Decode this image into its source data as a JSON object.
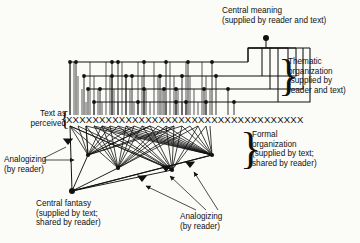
{
  "figure": {
    "title_absent": true,
    "text_row": {
      "label": "Text as\nperceived",
      "glyph": "X",
      "count": 36,
      "y": 122
    },
    "labels": {
      "central_meaning": "Central meaning\n(supplied by reader and text)",
      "thematic_organization": "Thematic\norganization\n(supplied by\nreader and text)",
      "formal_organization": "Formal\norganization\n(supplied by text;\nshared by reader)",
      "central_fantasy": "Central fantasy\n(supplied by text;\nshared by reader)",
      "analogizing_left": "Analogizing\n(by reader)",
      "analogizing_bottom": "Analogizing\n(by reader)"
    },
    "braces": {
      "text_as_perceived": "{",
      "thematic": "}",
      "formal": "}"
    },
    "colors": {
      "ink": "#111111",
      "background": "#fbfbf8"
    }
  },
  "chart_data": {
    "type": "diagram",
    "text_row_x_positions": [
      70,
      74,
      78,
      82,
      86,
      90,
      94,
      98,
      102,
      106,
      110,
      114,
      118,
      122,
      126,
      130,
      134,
      138,
      142,
      146,
      150,
      154,
      158,
      162,
      166,
      170,
      174,
      178,
      182,
      186,
      190,
      194,
      198,
      202,
      206,
      210
    ],
    "thematic_levels": [
      {
        "level": 1,
        "y": 62,
        "bus_x_start": 70,
        "bus_x_end": 248,
        "node_x": [
          70,
          76,
          112,
          118,
          144,
          166,
          188,
          212
        ]
      },
      {
        "level": 2,
        "y": 76,
        "bus_x_start": 84,
        "bus_x_end": 262,
        "node_x": [
          84,
          112,
          126,
          132,
          160,
          182,
          216
        ]
      },
      {
        "level": 3,
        "y": 89,
        "bus_x_start": 88,
        "bus_x_end": 270,
        "node_x": [
          88,
          100,
          144,
          164,
          176,
          204,
          228
        ]
      },
      {
        "level": 4,
        "y": 102,
        "bus_x_start": 94,
        "bus_x_end": 278,
        "node_x": [
          94,
          138,
          176,
          186,
          206,
          234
        ]
      }
    ],
    "central_meaning_node": {
      "x": 266,
      "y": 38
    },
    "formal_nodes": [
      {
        "x": 88,
        "y": 155
      },
      {
        "x": 118,
        "y": 168
      },
      {
        "x": 172,
        "y": 170
      },
      {
        "x": 212,
        "y": 155
      }
    ],
    "central_fantasy_node": {
      "x": 72,
      "y": 191
    },
    "arrow_markers": [
      {
        "name": "analogizing-left-upper",
        "x": 68,
        "y": 145
      },
      {
        "name": "analogizing-left-lower",
        "x": 76,
        "y": 159
      },
      {
        "name": "analogizing-bottom-1",
        "x": 142,
        "y": 182
      },
      {
        "name": "analogizing-bottom-2",
        "x": 166,
        "y": 172
      },
      {
        "name": "analogizing-bottom-3",
        "x": 190,
        "y": 168
      }
    ]
  }
}
